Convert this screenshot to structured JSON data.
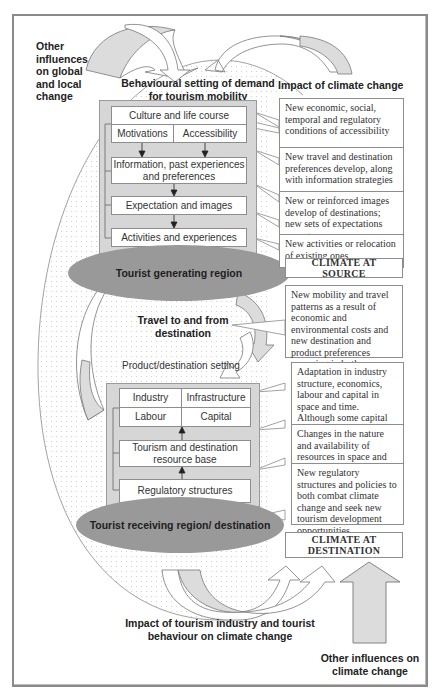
{
  "labels": {
    "other_influences_global": "Other influences on global and local change",
    "behavioural_setting": "Behavioural setting of demand for tourism mobility",
    "impact_of_climate_change": "Impact of climate change",
    "travel_to_from": "Travel to and from destination",
    "product_destination_setting": "Product/destination setting",
    "impact_of_tourism": "Impact of tourism industry and tourist behaviour on climate change",
    "other_influences_climate": "Other influences on climate change"
  },
  "demand_panel": {
    "culture": "Culture and life course",
    "motivations": "Motivations",
    "accessibility": "Accessibility",
    "information": "Information, past experiences and preferences",
    "expectation": "Expectation and images",
    "activities": "Activities and experiences"
  },
  "generating_region": "Tourist generating region",
  "supply_panel": {
    "industry": "Industry",
    "infrastructure": "Infrastructure",
    "labour": "Labour",
    "capital": "Capital",
    "resource_base": "Tourism and destination resource base",
    "regulatory": "Regulatory structures"
  },
  "receiving_region": "Tourist receiving region/ destination",
  "impacts": [
    "New economic, social, temporal and regulatory conditions of accessibility",
    "New travel and destination preferences develop, along with information strategies",
    "New or reinforced images develop of destinations; new sets of expectations emerge",
    "New activities or relocation of existing ones",
    "CLIMATE AT SOURCE",
    "New mobility and travel patterns as a result of economic and environmental costs and new destination and product preferences emerging in both space and time",
    "Adaptation in industry structure, economics, labour and capital in space and time. Although some capital will be immobile",
    "Changes in the nature and availability of resources in space and time",
    "New regulatory structures and policies to both combat climate change and seek new tourism development opportunities",
    "CLIMATE AT DESTINATION"
  ],
  "colors": {
    "frame": "#8a8a8a",
    "panel": "#d6d6d6",
    "ellipse": "#999999",
    "arrow_fill": "#dcdcdc",
    "dots": "#cfcfcf"
  }
}
